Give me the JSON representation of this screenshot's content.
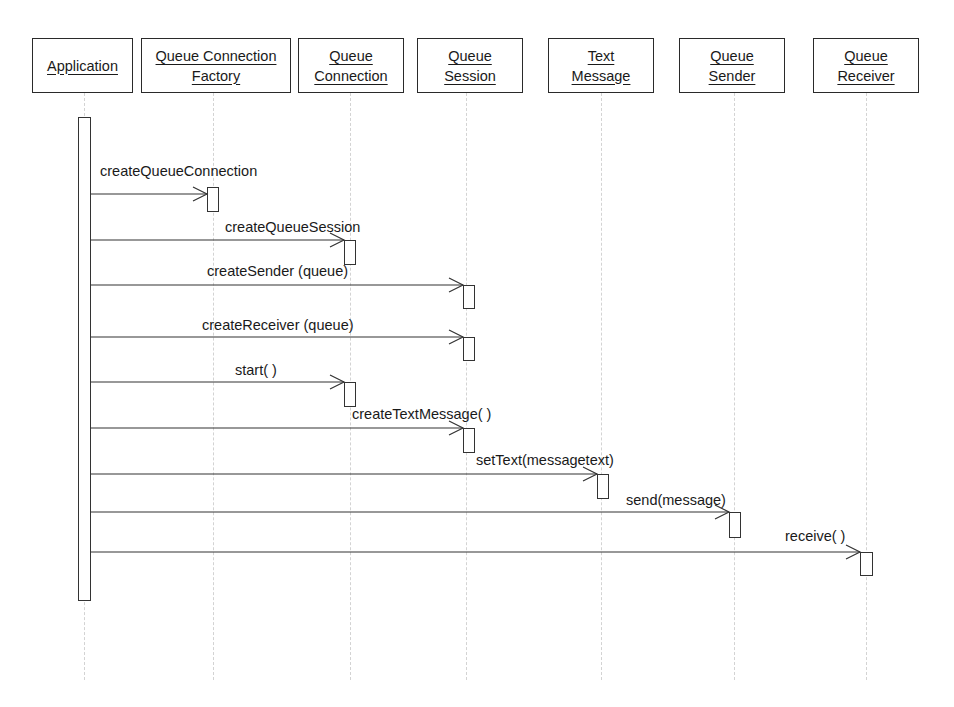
{
  "diagram": {
    "type": "UML sequence diagram",
    "objects": [
      {
        "id": "application",
        "line1": "Application",
        "line2": ""
      },
      {
        "id": "queue-connection-factory",
        "line1": "Queue Connection",
        "line2": "Factory"
      },
      {
        "id": "queue-connection",
        "line1": "Queue",
        "line2": "Connection"
      },
      {
        "id": "queue-session",
        "line1": "Queue",
        "line2": "Session"
      },
      {
        "id": "text-message",
        "line1": "Text",
        "line2": "Message"
      },
      {
        "id": "queue-sender",
        "line1": "Queue",
        "line2": "Sender"
      },
      {
        "id": "queue-receiver",
        "line1": "Queue",
        "line2": "Receiver"
      }
    ],
    "messages": [
      {
        "label": "createQueueConnection",
        "from": "Application",
        "to": "Queue Connection Factory"
      },
      {
        "label": "createQueueSession",
        "from": "Application",
        "to": "Queue Connection"
      },
      {
        "label": "createSender  (queue)",
        "from": "Application",
        "to": "Queue Session"
      },
      {
        "label": "createReceiver  (queue)",
        "from": "Application",
        "to": "Queue Session"
      },
      {
        "label": "start( )",
        "from": "Application",
        "to": "Queue Connection"
      },
      {
        "label": "createTextMessage( )",
        "from": "Application",
        "to": "Queue Session"
      },
      {
        "label": "setText(messagetext)",
        "from": "Application",
        "to": "Text Message"
      },
      {
        "label": "send(message)",
        "from": "Application",
        "to": "Queue Sender"
      },
      {
        "label": "receive( )",
        "from": "Application",
        "to": "Queue Receiver"
      }
    ]
  }
}
